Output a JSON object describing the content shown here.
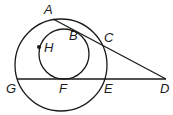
{
  "diagram": {
    "type": "geometry",
    "colors": {
      "stroke": "#1a1a1a",
      "background": "#ffffff"
    },
    "circles": [
      {
        "name": "large-circle",
        "cx": 61,
        "cy": 65,
        "r": 46
      },
      {
        "name": "small-circle",
        "cx": 64,
        "cy": 54,
        "r": 25
      }
    ],
    "segments": [
      {
        "name": "segment-AD",
        "from": "A",
        "to": "D"
      },
      {
        "name": "segment-GD",
        "from": "G",
        "to": "D"
      }
    ],
    "points": [
      {
        "id": "A",
        "label": "A",
        "x": 53,
        "y": 19,
        "lx": 44,
        "ly": 14
      },
      {
        "id": "B",
        "label": "B",
        "x": 82,
        "y": 35,
        "lx": 69,
        "ly": 40
      },
      {
        "id": "C",
        "label": "C",
        "x": 101,
        "y": 44,
        "lx": 104,
        "ly": 42
      },
      {
        "id": "D",
        "label": "D",
        "x": 166,
        "y": 79,
        "lx": 160,
        "ly": 93
      },
      {
        "id": "E",
        "label": "E",
        "x": 104,
        "y": 79,
        "lx": 104,
        "ly": 93
      },
      {
        "id": "F",
        "label": "F",
        "x": 64,
        "y": 79,
        "lx": 59,
        "ly": 93
      },
      {
        "id": "G",
        "label": "G",
        "x": 17,
        "y": 79,
        "lx": 6,
        "ly": 93
      },
      {
        "id": "H",
        "label": "H",
        "x": 39,
        "y": 47,
        "lx": 44,
        "ly": 52
      }
    ]
  }
}
